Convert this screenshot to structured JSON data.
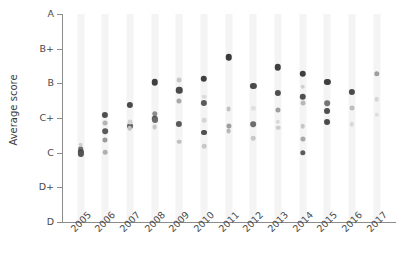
{
  "chart_data": {
    "type": "scatter",
    "title": "",
    "xlabel": "",
    "ylabel": "Average score",
    "x_tick_labels": [
      "2005",
      "2006",
      "2007",
      "2008",
      "2009",
      "2010",
      "2011",
      "2012",
      "2013",
      "2014",
      "2015",
      "2016",
      "2017"
    ],
    "y_tick_labels": [
      "D",
      "D+",
      "C",
      "C+",
      "B",
      "B+",
      "A"
    ],
    "y_tick_values": [
      0,
      1,
      2,
      3,
      4,
      5,
      6
    ],
    "ylim": [
      0,
      6
    ],
    "grid": "vertical-bands",
    "legend": "none",
    "point_shape": "circle",
    "note": "Grade scale: D=0, D+=1, C=2, C+=3, B=4, B+=5, A=6. Points are semi-transparent grey circles of varying darkness/size at each year.",
    "points": [
      {
        "x": "2005",
        "y": 2.1,
        "shade": "#6e6e6e",
        "size": 4.2
      },
      {
        "x": "2005",
        "y": 2.02,
        "shade": "#4a4a4a",
        "size": 4.6
      },
      {
        "x": "2005",
        "y": 1.97,
        "shade": "#555555",
        "size": 4.6
      },
      {
        "x": "2005",
        "y": 2.23,
        "shade": "#cfcfcf",
        "size": 3.4
      },
      {
        "x": "2006",
        "y": 3.08,
        "shade": "#4f4f4f",
        "size": 4.6
      },
      {
        "x": "2006",
        "y": 2.85,
        "shade": "#b5b5b5",
        "size": 3.6
      },
      {
        "x": "2006",
        "y": 2.62,
        "shade": "#5a5a5a",
        "size": 4.2
      },
      {
        "x": "2006",
        "y": 2.37,
        "shade": "#9a9a9a",
        "size": 3.8
      },
      {
        "x": "2006",
        "y": 2.02,
        "shade": "#b0b0b0",
        "size": 3.4
      },
      {
        "x": "2007",
        "y": 3.37,
        "shade": "#4a4a4a",
        "size": 4.6
      },
      {
        "x": "2007",
        "y": 2.78,
        "shade": "#5e5e5e",
        "size": 4.4
      },
      {
        "x": "2007",
        "y": 2.88,
        "shade": "#d2d2d2",
        "size": 3.6
      },
      {
        "x": "2007",
        "y": 2.7,
        "shade": "#c2c2c2",
        "size": 3.4
      },
      {
        "x": "2008",
        "y": 4.03,
        "shade": "#3f3f3f",
        "size": 4.8
      },
      {
        "x": "2008",
        "y": 3.12,
        "shade": "#8d8d8d",
        "size": 4.0
      },
      {
        "x": "2008",
        "y": 2.98,
        "shade": "#4f4f4f",
        "size": 4.8
      },
      {
        "x": "2008",
        "y": 2.93,
        "shade": "#6a6a6a",
        "size": 4.4
      },
      {
        "x": "2008",
        "y": 2.75,
        "shade": "#c6c6c6",
        "size": 3.6
      },
      {
        "x": "2009",
        "y": 3.8,
        "shade": "#4a4a4a",
        "size": 4.8
      },
      {
        "x": "2009",
        "y": 4.1,
        "shade": "#c8c8c8",
        "size": 3.6
      },
      {
        "x": "2009",
        "y": 3.5,
        "shade": "#a8a8a8",
        "size": 3.8
      },
      {
        "x": "2009",
        "y": 2.82,
        "shade": "#5a5a5a",
        "size": 4.6
      },
      {
        "x": "2009",
        "y": 2.32,
        "shade": "#c0c0c0",
        "size": 3.4
      },
      {
        "x": "2010",
        "y": 4.13,
        "shade": "#3f3f3f",
        "size": 4.8
      },
      {
        "x": "2010",
        "y": 3.43,
        "shade": "#5a5a5a",
        "size": 4.6
      },
      {
        "x": "2010",
        "y": 3.62,
        "shade": "#dcdcdc",
        "size": 3.4
      },
      {
        "x": "2010",
        "y": 2.93,
        "shade": "#d4d4d4",
        "size": 3.4
      },
      {
        "x": "2010",
        "y": 2.58,
        "shade": "#4f4f4f",
        "size": 4.4
      },
      {
        "x": "2010",
        "y": 2.18,
        "shade": "#c8c8c8",
        "size": 3.4
      },
      {
        "x": "2011",
        "y": 4.75,
        "shade": "#3a3a3a",
        "size": 4.8
      },
      {
        "x": "2011",
        "y": 3.25,
        "shade": "#c2c2c2",
        "size": 3.6
      },
      {
        "x": "2011",
        "y": 2.78,
        "shade": "#9e9e9e",
        "size": 3.8
      },
      {
        "x": "2011",
        "y": 2.62,
        "shade": "#b8b8b8",
        "size": 3.6
      },
      {
        "x": "2012",
        "y": 3.92,
        "shade": "#4a4a4a",
        "size": 4.6
      },
      {
        "x": "2012",
        "y": 2.82,
        "shade": "#6e6e6e",
        "size": 4.2
      },
      {
        "x": "2012",
        "y": 3.28,
        "shade": "#e0e0e0",
        "size": 3.2
      },
      {
        "x": "2012",
        "y": 2.42,
        "shade": "#c8c8c8",
        "size": 3.4
      },
      {
        "x": "2013",
        "y": 4.47,
        "shade": "#3f3f3f",
        "size": 4.8
      },
      {
        "x": "2013",
        "y": 3.72,
        "shade": "#4f4f4f",
        "size": 4.6
      },
      {
        "x": "2013",
        "y": 3.22,
        "shade": "#9e9e9e",
        "size": 3.8
      },
      {
        "x": "2013",
        "y": 2.72,
        "shade": "#cdcdcd",
        "size": 3.4
      },
      {
        "x": "2013",
        "y": 2.88,
        "shade": "#d8d8d8",
        "size": 3.2
      },
      {
        "x": "2014",
        "y": 4.28,
        "shade": "#3f3f3f",
        "size": 4.8
      },
      {
        "x": "2014",
        "y": 3.62,
        "shade": "#4f4f4f",
        "size": 4.8
      },
      {
        "x": "2014",
        "y": 3.9,
        "shade": "#d0d0d0",
        "size": 3.4
      },
      {
        "x": "2014",
        "y": 3.43,
        "shade": "#b8b8b8",
        "size": 3.6
      },
      {
        "x": "2014",
        "y": 2.77,
        "shade": "#c6c6c6",
        "size": 3.4
      },
      {
        "x": "2014",
        "y": 2.4,
        "shade": "#a8a8a8",
        "size": 3.8
      },
      {
        "x": "2014",
        "y": 2.0,
        "shade": "#5a5a5a",
        "size": 4.0
      },
      {
        "x": "2015",
        "y": 4.03,
        "shade": "#3f3f3f",
        "size": 4.6
      },
      {
        "x": "2015",
        "y": 3.42,
        "shade": "#757575",
        "size": 4.2
      },
      {
        "x": "2015",
        "y": 3.2,
        "shade": "#4f4f4f",
        "size": 4.4
      },
      {
        "x": "2015",
        "y": 2.88,
        "shade": "#4a4a4a",
        "size": 4.4
      },
      {
        "x": "2016",
        "y": 3.75,
        "shade": "#4a4a4a",
        "size": 4.6
      },
      {
        "x": "2016",
        "y": 3.28,
        "shade": "#bdbdbd",
        "size": 3.6
      },
      {
        "x": "2016",
        "y": 2.82,
        "shade": "#d8d8d8",
        "size": 3.2
      },
      {
        "x": "2017",
        "y": 4.28,
        "shade": "#9e9e9e",
        "size": 4.0
      },
      {
        "x": "2017",
        "y": 3.55,
        "shade": "#d6d6d6",
        "size": 3.4
      },
      {
        "x": "2017",
        "y": 3.1,
        "shade": "#dedede",
        "size": 3.2
      }
    ]
  },
  "axis": {
    "y_title": "Average score"
  }
}
